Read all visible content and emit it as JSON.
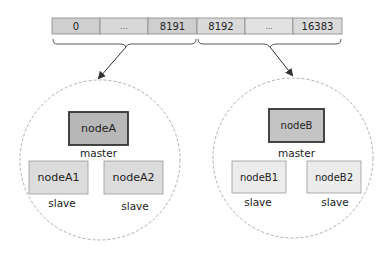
{
  "slot_bar": {
    "cells": [
      "0",
      "...",
      "8191",
      "8192",
      "...",
      "16383"
    ],
    "fill_colors": [
      "#cfcfcf",
      "#d8d8d8",
      "#cfcfcf",
      "#dadada",
      "#e2e2e2",
      "#dadada"
    ]
  },
  "groups": [
    {
      "master": {
        "label": "nodeA",
        "role": "master"
      },
      "slaves": [
        {
          "label": "nodeA1",
          "role": "slave"
        },
        {
          "label": "nodeA2",
          "role": "slave"
        }
      ]
    },
    {
      "master": {
        "label": "nodeB",
        "role": "master"
      },
      "slaves": [
        {
          "label": "nodeB1",
          "role": "slave"
        },
        {
          "label": "nodeB2",
          "role": "slave"
        }
      ]
    }
  ],
  "colors": {
    "master_fill_a": "#b8b8b8",
    "master_fill_b": "#c4c4c4",
    "slave_fill_a": "#dcdcdc",
    "slave_fill_b": "#ececec",
    "border": "#444444",
    "circle": "#9a9a9a"
  }
}
